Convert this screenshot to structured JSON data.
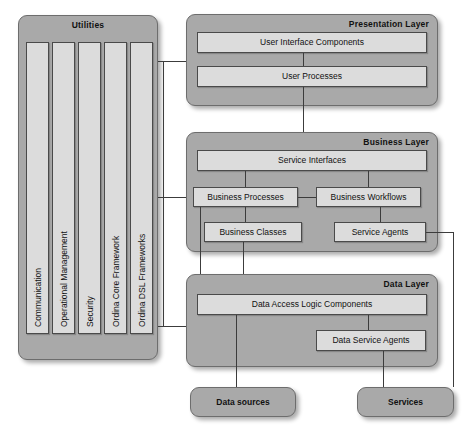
{
  "diagram": {
    "colors": {
      "panel_fill": "#a9a9a9",
      "panel_stroke": "#6d6d6d",
      "box_fill": "#dcdcdc",
      "box_stroke": "#4a4a4a",
      "line": "#3c3c3c",
      "background": "#ffffff",
      "text": "#111111"
    }
  },
  "utilities": {
    "title": "Utilities",
    "columns": [
      {
        "label": "Communication"
      },
      {
        "label": "Operational Management"
      },
      {
        "label": "Security"
      },
      {
        "label": "Ordina Core Framework"
      },
      {
        "label": "Ordina DSL Frameworks"
      }
    ]
  },
  "presentation_layer": {
    "title": "Presentation Layer",
    "boxes": [
      {
        "label": "User Interface Components"
      },
      {
        "label": "User Processes"
      }
    ]
  },
  "business_layer": {
    "title": "Business  Layer",
    "boxes": [
      {
        "label": "Service Interfaces"
      },
      {
        "label": "Business Processes"
      },
      {
        "label": "Business Workflows"
      },
      {
        "label": "Business Classes"
      },
      {
        "label": "Service Agents"
      }
    ]
  },
  "data_layer": {
    "title": "Data Layer",
    "boxes": [
      {
        "label": "Data Access Logic Components"
      },
      {
        "label": "Data Service Agents"
      }
    ]
  },
  "external": {
    "data_sources": {
      "label": "Data sources"
    },
    "services": {
      "label": "Services"
    }
  }
}
